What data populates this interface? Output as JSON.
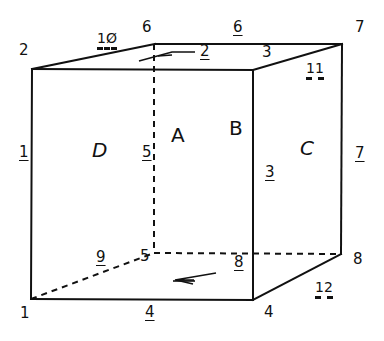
{
  "diagram": {
    "type": "cube-wireframe",
    "line_color": "#111111",
    "background": "#ffffff",
    "vertices": [
      {
        "id": "1",
        "label": "1"
      },
      {
        "id": "2",
        "label": "2"
      },
      {
        "id": "3",
        "label": "3"
      },
      {
        "id": "4",
        "label": "4"
      },
      {
        "id": "5",
        "label": "5"
      },
      {
        "id": "6",
        "label": "6"
      },
      {
        "id": "7",
        "label": "7"
      },
      {
        "id": "8",
        "label": "8"
      }
    ],
    "edges": [
      {
        "label": "1"
      },
      {
        "label": "2"
      },
      {
        "label": "3"
      },
      {
        "label": "4"
      },
      {
        "label": "5"
      },
      {
        "label": "6"
      },
      {
        "label": "7"
      },
      {
        "label": "8"
      },
      {
        "label": "9"
      },
      {
        "label": "10"
      },
      {
        "label": "11"
      },
      {
        "label": "12"
      }
    ],
    "faces": [
      {
        "label": "A"
      },
      {
        "label": "B"
      },
      {
        "label": "C"
      },
      {
        "label": "D"
      },
      {
        "label": "E",
        "note": "top face, sketched glyph"
      },
      {
        "label": "F",
        "note": "bottom face, sketched glyph"
      }
    ]
  },
  "labels": {
    "v1": "1",
    "v2": "2",
    "v3": "3",
    "v4": "4",
    "v5": "5",
    "v6": "6",
    "v7": "7",
    "v8": "8",
    "e1": "1",
    "e2": "2",
    "e3": "3",
    "e4": "4",
    "e5": "5",
    "e6": "6",
    "e7": "7",
    "e8": "8",
    "e9": "9",
    "e10": "1Ø",
    "e11": "11",
    "e12": "12",
    "fA": "A",
    "fB": "B",
    "fC": "C",
    "fD": "D"
  }
}
